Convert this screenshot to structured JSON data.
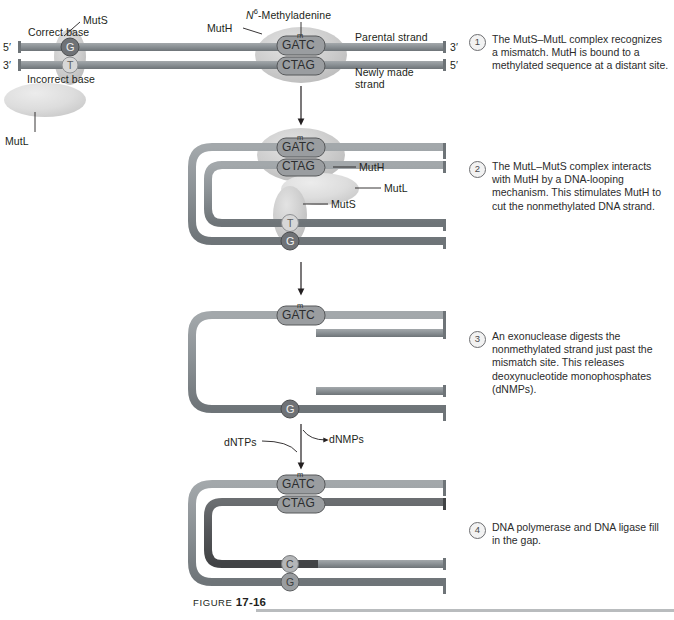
{
  "figure": {
    "caption_prefix": "FIGURE ",
    "caption_number": "17-16"
  },
  "colors": {
    "parental_strand": "#8c9296",
    "newly_made_strand": "#8c9296",
    "repaired_strand": "#55575a",
    "protein_fill": "#c9c9c9",
    "protein_fill_light": "#dcdcdc",
    "base_dark": "#6f7276",
    "base_light": "#d7d7d7",
    "gatc_box": "#9a9da0",
    "text": "#231f20",
    "rule": "#b9bcbe"
  },
  "panel1": {
    "labels": {
      "muts": "MutS",
      "mutl": "MutL",
      "muth": "MutH",
      "correct_base": "Correct base",
      "incorrect_base": "Incorrect base",
      "methyladenine": "N6-Methyladenine",
      "methyladenine_base": "N",
      "methyladenine_sup": "6",
      "methyladenine_rest": "-Methyladenine",
      "parental_strand": "Parental strand",
      "newly_made_strand_line1": "Newly made",
      "newly_made_strand_line2": "strand",
      "five_prime_left": "5′",
      "three_prime_left": "3′",
      "three_prime_right": "3′",
      "five_prime_right": "5′"
    },
    "bases": {
      "correct": "G",
      "incorrect": "T"
    },
    "sequence": {
      "methyl_mark": "m",
      "top": "GATC",
      "bottom": "CTAG"
    }
  },
  "panel2": {
    "labels": {
      "muth": "MutH",
      "mutl": "MutL",
      "muts": "MutS"
    },
    "bases": {
      "top": "T",
      "bottom": "G"
    },
    "sequence": {
      "methyl_mark": "m",
      "top": "GATC",
      "bottom": "CTAG"
    }
  },
  "panel3": {
    "bases": {
      "bottom": "G"
    },
    "sequence": {
      "methyl_mark": "m",
      "top": "GATC"
    },
    "labels": {
      "dntps": "dNTPs",
      "dnmps": "dNMPs"
    }
  },
  "panel4": {
    "bases": {
      "top": "C",
      "bottom": "G"
    },
    "sequence": {
      "methyl_mark": "m",
      "top": "GATC",
      "bottom": "CTAG"
    }
  },
  "steps": [
    {
      "number": "1",
      "text": "The MutS–MutL complex recognizes a mismatch. MutH is bound to a methylated sequence at a distant site."
    },
    {
      "number": "2",
      "text": "The MutL–MutS complex interacts with MutH by a DNA-looping mechanism. This stimulates MutH to cut the nonmethylated DNA strand."
    },
    {
      "number": "3",
      "text": "An exonuclease digests the nonmethylated strand just past the mismatch site. This releases deoxynucleotide monophosphates (dNMPs)."
    },
    {
      "number": "4",
      "text": "DNA polymerase and DNA ligase fill in the gap."
    }
  ]
}
